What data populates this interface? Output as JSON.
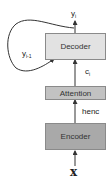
{
  "diagram": {
    "nodes": {
      "decoder": {
        "label": "Decoder",
        "fill": "#e2e2e2"
      },
      "attention": {
        "label": "Attention",
        "fill": "#c2c2c2"
      },
      "encoder": {
        "label": "Encoder",
        "fill": "#a9a9a9"
      }
    },
    "labels": {
      "output_y": "y",
      "output_sub": "i",
      "prev_y": "y",
      "prev_sub": "i-1",
      "context_c": "c",
      "context_sub": "i",
      "henc": "henc",
      "input_x": "x"
    },
    "edges": [
      {
        "from": "input_x",
        "to": "encoder"
      },
      {
        "from": "encoder",
        "to": "attention",
        "label": "henc"
      },
      {
        "from": "attention",
        "to": "decoder",
        "label": "c_i"
      },
      {
        "from": "decoder",
        "to": "output_y",
        "label": "y_i"
      },
      {
        "from": "output_y",
        "to": "decoder",
        "label": "y_i-1",
        "type": "feedback-loop"
      }
    ]
  }
}
